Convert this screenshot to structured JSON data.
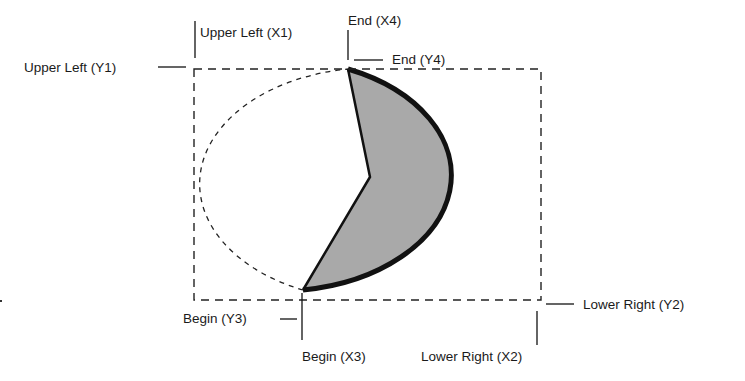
{
  "diagram": {
    "type": "pie-arc-geometry",
    "colors": {
      "fill": "#a9a9a9",
      "stroke": "#111111",
      "dash": "#222222",
      "text": "#1a1a1a",
      "background": "#ffffff"
    },
    "bounding_box": {
      "x1": 194,
      "y1": 69,
      "x2": 541,
      "y2": 300
    },
    "pie_center": {
      "x": 370,
      "y": 177
    },
    "begin_point": {
      "x": 303,
      "y": 290
    },
    "end_point": {
      "x": 348,
      "y": 69
    },
    "labels": {
      "upper_left_x": "Upper Left (X1)",
      "upper_left_y": "Upper Left (Y1)",
      "end_x": "End (X4)",
      "end_y": "End (Y4)",
      "begin_x": "Begin (X3)",
      "begin_y": "Begin (Y3)",
      "lower_right_x": "Lower Right (X2)",
      "lower_right_y": "Lower Right (Y2)"
    }
  }
}
